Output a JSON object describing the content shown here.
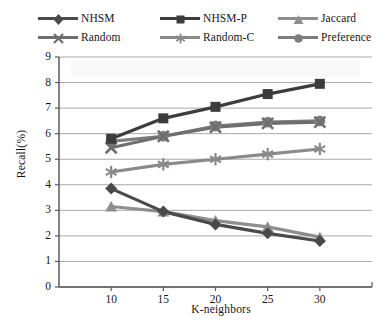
{
  "chart_data": {
    "type": "line",
    "title": "",
    "xlabel": "K-neighbors",
    "ylabel": "Recall(%)",
    "categories": [
      "10",
      "15",
      "20",
      "25",
      "30"
    ],
    "x": [
      10,
      15,
      20,
      25,
      30
    ],
    "ylim": [
      0,
      9
    ],
    "yticks": [
      "0",
      "1",
      "2",
      "3",
      "4",
      "5",
      "6",
      "7",
      "8",
      "9"
    ],
    "grid": "horizontal",
    "legend_position": "top",
    "series": [
      {
        "name": "NHSM",
        "marker": "diamond",
        "color": "#4a4a4a",
        "values": [
          3.85,
          2.95,
          2.45,
          2.1,
          1.8
        ]
      },
      {
        "name": "NHSM-P",
        "marker": "square",
        "color": "#3c3c3c",
        "values": [
          5.8,
          6.6,
          7.05,
          7.55,
          7.95
        ]
      },
      {
        "name": "Jaccard",
        "marker": "triangle",
        "color": "#8e8e8e",
        "values": [
          3.15,
          2.95,
          2.6,
          2.35,
          1.95
        ]
      },
      {
        "name": "Random",
        "marker": "cross",
        "color": "#6e6e6e",
        "values": [
          5.45,
          5.9,
          6.25,
          6.4,
          6.45
        ]
      },
      {
        "name": "Random-C",
        "marker": "asterisk",
        "color": "#8a8a8a",
        "values": [
          4.5,
          4.8,
          5.0,
          5.2,
          5.4
        ]
      },
      {
        "name": "Preference",
        "marker": "circle",
        "color": "#7d7d7d",
        "values": [
          5.7,
          5.9,
          6.3,
          6.45,
          6.5
        ]
      }
    ]
  },
  "legend": {
    "rows": [
      [
        "NHSM",
        "NHSM-P",
        "Jaccard"
      ],
      [
        "Random",
        "Random-C",
        "Preference"
      ]
    ]
  },
  "colors": {
    "axis": "#5a5a5a",
    "grid": "#9a9a9a",
    "text": "#161616",
    "background": "#ffffff"
  }
}
